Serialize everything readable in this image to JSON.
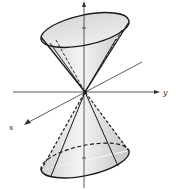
{
  "figure": {
    "axes": {
      "x_label": "x",
      "y_label": "y"
    },
    "colors": {
      "stroke": "#1a1a1a",
      "fill_light": "#ececec",
      "fill_dark": "#c8c8c8",
      "axis": "#333333"
    },
    "nappes": [
      "upper",
      "lower"
    ]
  }
}
